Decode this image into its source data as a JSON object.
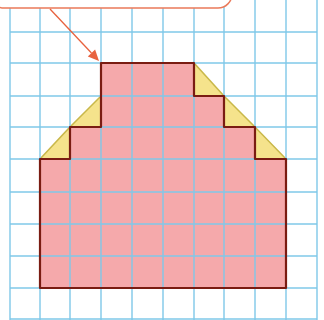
{
  "diagram": {
    "type": "grid-area-figure",
    "grid": {
      "x_lines": [
        10,
        40,
        70,
        101,
        132,
        163,
        194,
        224,
        255,
        286,
        317
      ],
      "y_lines": [
        32,
        63,
        96,
        127,
        159,
        192,
        224,
        256,
        288,
        319
      ],
      "color": "#7fc8e8"
    },
    "shape": {
      "fill": "#f5a9ab",
      "stroke": "#7a1c12",
      "points": [
        [
          101,
          63
        ],
        [
          194,
          63
        ],
        [
          194,
          96
        ],
        [
          224,
          96
        ],
        [
          224,
          127
        ],
        [
          255,
          127
        ],
        [
          255,
          159
        ],
        [
          286,
          159
        ],
        [
          286,
          288
        ],
        [
          40,
          288
        ],
        [
          40,
          159
        ],
        [
          70,
          159
        ],
        [
          70,
          127
        ],
        [
          101,
          127
        ]
      ]
    },
    "triangles": {
      "fill": "#f5e38c",
      "stroke": "#c9b84a",
      "items": [
        [
          [
            101,
            96
          ],
          [
            101,
            127
          ],
          [
            70,
            127
          ]
        ],
        [
          [
            70,
            127
          ],
          [
            70,
            159
          ],
          [
            40,
            159
          ]
        ],
        [
          [
            194,
            63
          ],
          [
            194,
            96
          ],
          [
            224,
            96
          ]
        ],
        [
          [
            224,
            96
          ],
          [
            224,
            127
          ],
          [
            255,
            127
          ]
        ],
        [
          [
            255,
            127
          ],
          [
            255,
            159
          ],
          [
            286,
            159
          ]
        ]
      ]
    },
    "callout": {
      "text": "",
      "border_color": "#ea7a5a",
      "box": {
        "x": -10,
        "y": -30,
        "w": 242,
        "h": 38
      }
    },
    "arrow": {
      "from": [
        50,
        9
      ],
      "to": [
        99,
        61
      ],
      "color": "#e8623e"
    }
  }
}
